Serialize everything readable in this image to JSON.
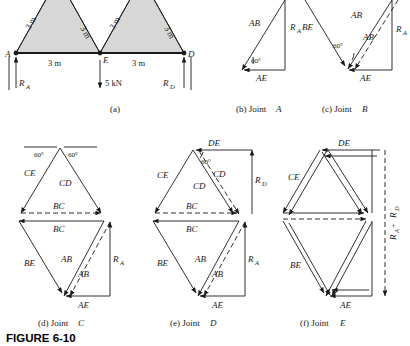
{
  "figure": {
    "number": "FIGURE 6-10",
    "captions": {
      "a": "(a)",
      "b_prefix": "(b)  Joint",
      "b_joint": "A",
      "c_prefix": "(c)  Joint",
      "c_joint": "B",
      "d_prefix": "(d)  Joint",
      "d_joint": "C",
      "e_prefix": "(e)  Joint",
      "e_joint": "D",
      "f_prefix": "(f)  Joint",
      "f_joint": "E"
    }
  },
  "truss": {
    "joints": {
      "a": "A",
      "e": "E",
      "d": "D"
    },
    "member_lengths": [
      "3 m",
      "3 m",
      "3 m",
      "3 m"
    ],
    "span_labels": [
      "3 m",
      "3 m"
    ],
    "load": "5 kN",
    "reactions": {
      "left": "R",
      "left_sub": "A",
      "right": "R",
      "right_sub": "D"
    }
  },
  "joint_a": {
    "members": [
      "AB",
      "AE"
    ],
    "reaction": "R",
    "reaction_sub": "A",
    "angle": "60°"
  },
  "joint_b": {
    "members": [
      "BE",
      "AB",
      "AB",
      "AE"
    ],
    "reaction": "R",
    "reaction_sub": "A",
    "angle": "60°"
  },
  "joint_c": {
    "upper_members": [
      "CE",
      "CD",
      "BC"
    ],
    "lower_members": [
      "BC",
      "BE",
      "AB",
      "AB",
      "AE"
    ],
    "reaction": "R",
    "reaction_sub": "A",
    "angles": [
      "60°",
      "60°"
    ]
  },
  "joint_d": {
    "upper_members": [
      "DE",
      "CE",
      "CD",
      "CD",
      "BC"
    ],
    "lower_members": [
      "BC",
      "BE",
      "AB",
      "AB",
      "AE"
    ],
    "reaction_d": "R",
    "reaction_d_sub": "D",
    "reaction_a": "R",
    "reaction_a_sub": "A",
    "angle": "60°"
  },
  "joint_e": {
    "members": [
      "DE",
      "CE",
      "BE",
      "AE"
    ],
    "reaction": "R",
    "reaction_sub_a": "A",
    "reaction_plus": " + ",
    "reaction_sub_d": "D",
    "reaction_label_full": "R_A + R_D"
  },
  "colors": {
    "ink": "#1a1a1a",
    "truss_fill": "#d7d7d7",
    "background": "#ffffff"
  }
}
